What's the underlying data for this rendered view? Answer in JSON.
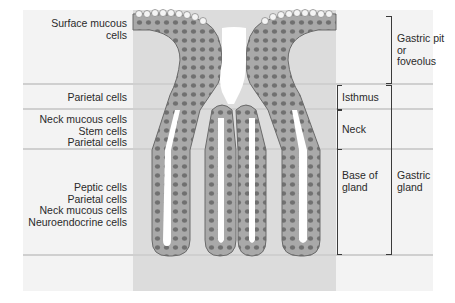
{
  "figure": {
    "left_labels": {
      "surface": "Surface mucous cells",
      "isthmus": "Parietal cells",
      "neck": [
        "Neck mucous cells",
        "Stem cells",
        "Parietal cells"
      ],
      "base": [
        "Peptic cells",
        "Parietal cells",
        "Neck mucous cells",
        "Neuroendocrine cells"
      ]
    },
    "region_labels": {
      "isthmus": "Isthmus",
      "neck": "Neck",
      "base": [
        "Base of",
        "gland"
      ]
    },
    "group_labels": {
      "pit": [
        "Gastric pit",
        "or",
        "foveolus"
      ],
      "gland": [
        "Gastric",
        "gland"
      ]
    },
    "colors": {
      "background": "#f3f3f3",
      "tissue": "#dcdcdc",
      "epithelium": "#9a9a9a",
      "lumen": "#ffffff",
      "nucleus": "#6e6e6e",
      "band_line": "#cfcfcf"
    }
  }
}
